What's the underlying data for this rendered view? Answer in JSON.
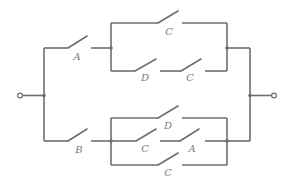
{
  "diagram": {
    "type": "switching-circuit",
    "colors": {
      "wire": "#6e6e6e",
      "label": "#7a7a7a",
      "background": "#ffffff"
    },
    "terminals": [
      "input",
      "output"
    ],
    "branches": {
      "upper": {
        "series_switch": "A",
        "parallel_paths": [
          [
            "C"
          ],
          [
            "D",
            "C"
          ]
        ]
      },
      "lower": {
        "series_switch": "B",
        "parallel_paths": [
          [
            "D"
          ],
          [
            "C",
            "A"
          ],
          [
            "C"
          ]
        ]
      }
    },
    "labels": {
      "upper_series": "A",
      "upper_path1_s1": "C",
      "upper_path2_s1": "D",
      "upper_path2_s2": "C",
      "lower_series": "B",
      "lower_path1_s1": "D",
      "lower_path2_s1": "C",
      "lower_path2_s2": "A",
      "lower_path3_s1": "C"
    }
  }
}
